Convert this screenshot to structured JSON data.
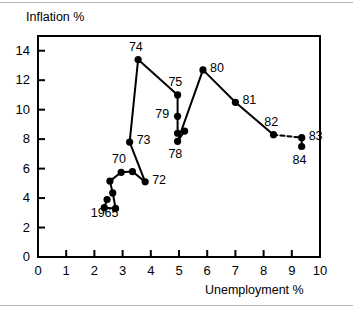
{
  "chart_data": {
    "type": "line",
    "title": "",
    "xlabel": "Unemployment %",
    "ylabel": "Inflation %",
    "xlim": [
      0,
      10
    ],
    "ylim": [
      0,
      15
    ],
    "xticks": [
      0,
      1,
      2,
      3,
      4,
      5,
      6,
      7,
      8,
      9,
      10
    ],
    "yticks": [
      0,
      2,
      4,
      6,
      8,
      10,
      12,
      14
    ],
    "xtick_labels": [
      "0",
      "1",
      "2",
      "3",
      "4",
      "5",
      "6",
      "7",
      "8",
      "9",
      "10"
    ],
    "ytick_labels": [
      "0",
      "2",
      "4",
      "6",
      "8",
      "10",
      "12",
      "14"
    ],
    "grid": false,
    "legend": false,
    "series": [
      {
        "name": "Inflation vs Unemployment",
        "points": [
          {
            "label": "1965",
            "x": 2.45,
            "y": 3.9,
            "label_pos": "below"
          },
          {
            "label": "",
            "x": 2.35,
            "y": 3.35,
            "label_pos": "none"
          },
          {
            "label": "",
            "x": 2.75,
            "y": 3.3,
            "label_pos": "none"
          },
          {
            "label": "",
            "x": 2.65,
            "y": 4.35,
            "label_pos": "none"
          },
          {
            "label": "",
            "x": 2.55,
            "y": 5.15,
            "label_pos": "none"
          },
          {
            "label": "70",
            "x": 2.95,
            "y": 5.75,
            "label_pos": "above"
          },
          {
            "label": "",
            "x": 3.35,
            "y": 5.8,
            "label_pos": "none"
          },
          {
            "label": "72",
            "x": 3.8,
            "y": 5.1,
            "label_pos": "right"
          },
          {
            "label": "73",
            "x": 3.25,
            "y": 7.8,
            "label_pos": "right"
          },
          {
            "label": "74",
            "x": 3.55,
            "y": 13.4,
            "label_pos": "above"
          },
          {
            "label": "75",
            "x": 4.95,
            "y": 11.0,
            "label_pos": "above"
          },
          {
            "label": "79",
            "x": 4.95,
            "y": 9.55,
            "label_pos": "left"
          },
          {
            "label": "",
            "x": 4.95,
            "y": 8.4,
            "label_pos": "none"
          },
          {
            "label": "",
            "x": 5.2,
            "y": 8.55,
            "label_pos": "none"
          },
          {
            "label": "78",
            "x": 4.95,
            "y": 7.85,
            "label_pos": "below"
          },
          {
            "label": "80",
            "x": 5.85,
            "y": 12.7,
            "label_pos": "right"
          },
          {
            "label": "81",
            "x": 7.0,
            "y": 10.5,
            "label_pos": "right"
          },
          {
            "label": "82",
            "x": 8.35,
            "y": 8.3,
            "label_pos": "above"
          },
          {
            "label": "83",
            "x": 9.35,
            "y": 8.1,
            "label_pos": "right"
          },
          {
            "label": "84",
            "x": 9.35,
            "y": 7.5,
            "label_pos": "below"
          }
        ],
        "dashed_segments": [
          [
            17,
            18
          ]
        ],
        "color": "#000000"
      }
    ]
  },
  "colors": {
    "ink": "#000000",
    "background": "#ffffff",
    "rule": "#b8b8b8"
  }
}
